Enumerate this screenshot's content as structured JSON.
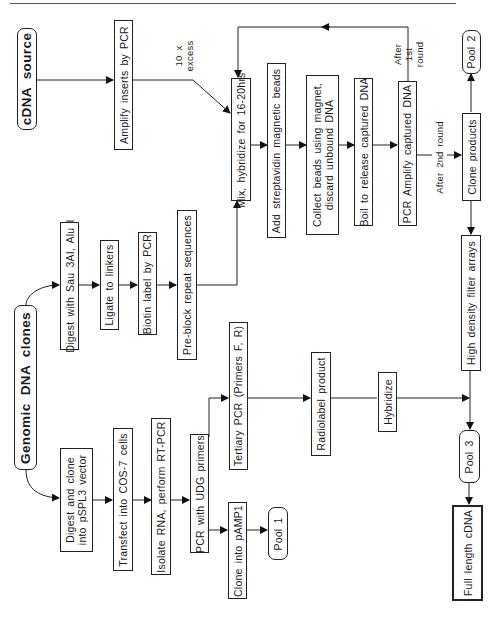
{
  "diagram": {
    "orientation": "rotated-90-ccw",
    "sources": {
      "cdna": "cDNA source",
      "genomic": "Genomic DNA clones"
    },
    "cdna_path": {
      "amplify": "Amplify inserts by PCR",
      "excess_label": "10 x\nexcess"
    },
    "genomic_upper_path": {
      "digest": "Digest with Sau 3AI, Alu I",
      "ligate": "Ligate to linkers",
      "biotin": "Biotin label by PCR",
      "preblock": "Pre-block repeat sequences"
    },
    "capture_loop": {
      "mix": "Mix, hybridize for 16-20hrs",
      "streptavidin": "Add streptavidin magnetic beads",
      "collect_line1": "Collect beads using magnet,",
      "collect_line2": "discard unbound DNA",
      "boil": "Boil to release captured DNA",
      "pcr_amplify": "PCR Amplify captured DNA",
      "after_first_line1": "After",
      "after_first_line2": "1st",
      "after_first_line3": "round",
      "after_second": "After 2nd round",
      "clone_products": "Clone products",
      "pool2": "Pool 2"
    },
    "genomic_lower_path": {
      "digest_clone_line1": "Digest and clone",
      "digest_clone_line2": "into pSPL3 vector",
      "transfect": "Transfect into COS-7 cells",
      "isolate": "Isolate RNA, perform RT-PCR",
      "pcr_udg": "PCR with UDG primers",
      "clone_pamp1": "Clone into pAMP1",
      "pool1": "Pool 1",
      "tertiary": "Tertiary PCR (Primers F, R)",
      "radiolabel": "Radiolabel product",
      "hybridize": "Hybridize"
    },
    "output": {
      "filter_arrays": "High density filter arrays",
      "pool3": "Pool 3",
      "full_length": "Full length cDNA"
    }
  }
}
